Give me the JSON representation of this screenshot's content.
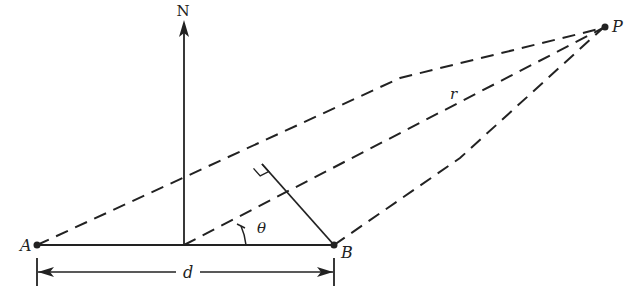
{
  "diagram": {
    "type": "geometry",
    "labels": {
      "north": "N",
      "point_a": "A",
      "point_b": "B",
      "point_p": "P",
      "range": "r",
      "angle": "θ",
      "separation": "d"
    },
    "colors": {
      "line": "#222222",
      "background": "#ffffff"
    },
    "points": {
      "A": [
        37,
        245
      ],
      "B": [
        334,
        245
      ],
      "P": [
        605,
        27
      ],
      "midpoint": [
        184,
        245
      ],
      "perp_foot": [
        262,
        164
      ],
      "upper_bend": [
        400,
        78
      ],
      "lower_bend": [
        460,
        158
      ]
    }
  }
}
